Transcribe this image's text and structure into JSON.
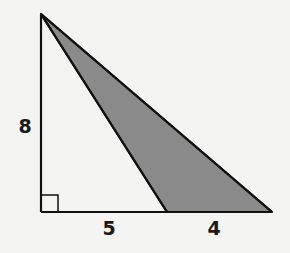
{
  "diagram": {
    "type": "geometry",
    "colors": {
      "background": "#f4f4f2",
      "stroke": "#111111",
      "shade": "#8a8a8a"
    },
    "points": {
      "apex": [
        41,
        14
      ],
      "right_angle_corner": [
        41,
        212
      ],
      "inner_base": [
        167,
        212
      ],
      "outer_base": [
        272,
        212
      ]
    },
    "labels": {
      "height": "8",
      "base_left": "5",
      "base_right": "4"
    },
    "label_positions": {
      "height": [
        25,
        133
      ],
      "base_left": [
        109,
        235
      ],
      "base_right": [
        214,
        235
      ]
    },
    "right_angle_marker_size": 17
  }
}
